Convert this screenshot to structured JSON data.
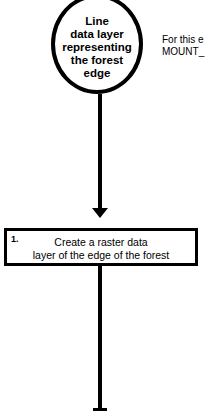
{
  "start_node": {
    "shape": "circle",
    "lines": [
      "Line",
      "data layer",
      "representing",
      "the forest",
      "edge"
    ]
  },
  "side_note": {
    "lines": [
      "For this e",
      "MOUNT_"
    ]
  },
  "steps": [
    {
      "number": "1.",
      "lines": [
        "Create a raster data",
        "layer of the edge of the forest"
      ]
    }
  ],
  "colors": {
    "stroke": "#000000",
    "background": "#ffffff"
  }
}
